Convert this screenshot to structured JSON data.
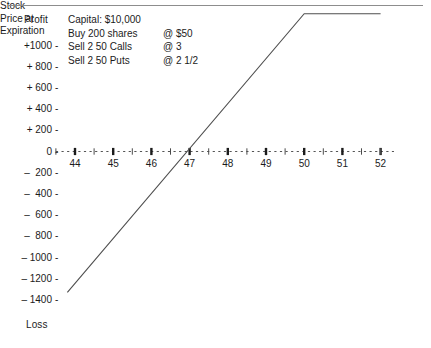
{
  "chart_data": {
    "type": "line",
    "title": "",
    "xlabel": "Stock Price at Expiration",
    "ylabel": "Profit",
    "ylabel_bottom": "Loss",
    "xlim": [
      43.5,
      52.4
    ],
    "ylim": [
      -1500,
      1420
    ],
    "grid": false,
    "legend_position": "top-left-inside",
    "x_ticks": [
      44,
      45,
      46,
      47,
      48,
      49,
      50,
      51,
      52
    ],
    "x_minor_ticks": [
      43.5,
      44.5,
      45.5,
      46.5,
      47.5,
      48.5,
      49.5,
      50.5,
      51.5,
      52.0
    ],
    "y_ticks": [
      1000,
      800,
      600,
      400,
      200,
      0,
      -200,
      -400,
      -600,
      -800,
      -1000,
      -1200,
      -1400
    ],
    "y_tick_labels": [
      "+1000",
      "+ 800",
      "+ 600",
      "+ 400",
      "+ 200",
      "0",
      "–  200",
      "–  400",
      "–  600",
      "–  800",
      "– 1000",
      "– 1200",
      "– 1400"
    ],
    "series": [
      {
        "name": "Profit / Loss at expiration",
        "x": [
          43.8,
          50.0,
          52.0
        ],
        "values": [
          -1330,
          1300,
          1300
        ]
      }
    ],
    "breakeven_x": 46.9,
    "max_profit": 1300,
    "annotations": [
      {
        "description": "Capital:  $10,000",
        "price": ""
      },
      {
        "description": "Buy 200 shares",
        "price": "@  $50"
      },
      {
        "description": "Sell 2 50 Calls",
        "price": "@  3"
      },
      {
        "description": "Sell 2 50 Puts",
        "price": "@  2 1/2"
      }
    ]
  },
  "axis": {
    "profit_label": "Profit",
    "loss_label": "Loss",
    "x_title_line1": "Stock",
    "x_title_line2": "Price at",
    "x_title_line3": "Expiration",
    "tick_dash": "-"
  },
  "colors": {
    "line": "#4f4f4f",
    "axis": "#555555",
    "tick": "#1b1b1b",
    "text": "#1b1b1b",
    "rule": "#8d8d8d",
    "background": "#ffffff"
  }
}
